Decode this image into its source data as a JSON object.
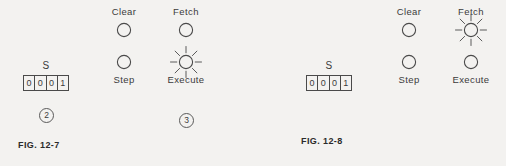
{
  "page": {
    "background_color": "#f3f2f0",
    "ink_color": "#3b3b3b"
  },
  "figures": [
    {
      "id": "fig-12-7",
      "caption": "FIG. 12-7",
      "register": {
        "label": "S",
        "cells": [
          "0",
          "0",
          "0",
          "1"
        ]
      },
      "lamps": [
        {
          "label": "Clear",
          "label_position": "above",
          "lit": false
        },
        {
          "label": "Fetch",
          "label_position": "above",
          "lit": false
        },
        {
          "label": "Step",
          "label_position": "below",
          "lit": false
        },
        {
          "label": "Execute",
          "label_position": "below",
          "lit": true
        }
      ],
      "callouts": [
        {
          "number": "2",
          "target": "register"
        },
        {
          "number": "3",
          "target": "execute-lamp"
        }
      ]
    },
    {
      "id": "fig-12-8",
      "caption": "FIG. 12-8",
      "register": {
        "label": "S",
        "cells": [
          "0",
          "0",
          "0",
          "1"
        ]
      },
      "lamps": [
        {
          "label": "Clear",
          "label_position": "above",
          "lit": false
        },
        {
          "label": "Fetch",
          "label_position": "above",
          "lit": true
        },
        {
          "label": "Step",
          "label_position": "below",
          "lit": false
        },
        {
          "label": "Execute",
          "label_position": "below",
          "lit": false
        }
      ],
      "callouts": []
    }
  ]
}
